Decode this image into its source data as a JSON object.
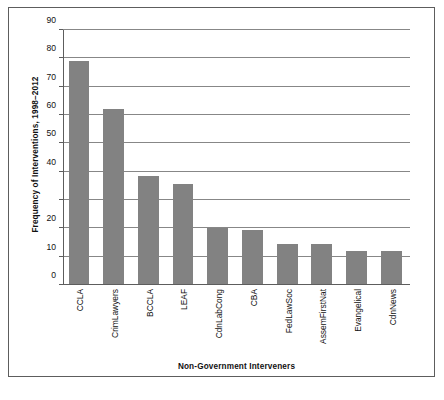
{
  "chart_data": {
    "type": "bar",
    "title": "",
    "xlabel": "Non-Government Interveners",
    "ylabel": "Frequency of Interventions, 1998–2012",
    "categories": [
      "CCLA",
      "CrimLawyers",
      "BCCLA",
      "LEAF",
      "CdnLabCong",
      "CBA",
      "FedLawSoc",
      "AssemFirstNat",
      "Evangelical",
      "CdnNews"
    ],
    "values": [
      79,
      62,
      38.5,
      35.5,
      20,
      19.5,
      14.5,
      14.5,
      12,
      12
    ],
    "ylim": [
      0,
      90
    ],
    "ytick_values": [
      0,
      10,
      20,
      30,
      40,
      50,
      60,
      70,
      80,
      90
    ],
    "ytick_labels": [
      "0",
      "10",
      "20",
      "",
      "40",
      "50",
      "60",
      "70",
      "80",
      "90"
    ],
    "grid": true,
    "grid_axis": "y",
    "legend": false,
    "bar_color": "#828282",
    "grid_color": "#878787",
    "axis_color": "#5d5d5d",
    "frame_color": "#5d5d5d",
    "background": "#ffffff"
  }
}
